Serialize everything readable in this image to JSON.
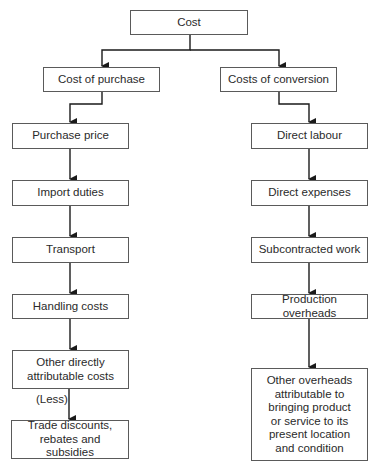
{
  "diagram": {
    "root": {
      "label": "Cost"
    },
    "branches": [
      {
        "label": "Cost of purchase",
        "items": [
          {
            "label": "Purchase price"
          },
          {
            "label": "Import duties"
          },
          {
            "label": "Transport"
          },
          {
            "label": "Handling costs"
          },
          {
            "label": "Other directly attributable costs"
          },
          {
            "label": "Trade discounts, rebates and subsidies"
          }
        ],
        "connector_note": "(Less)"
      },
      {
        "label": "Costs of conversion",
        "items": [
          {
            "label": "Direct labour"
          },
          {
            "label": "Direct expenses"
          },
          {
            "label": "Subcontracted work"
          },
          {
            "label": "Production overheads"
          },
          {
            "label": "Other overheads attributable to bringing product or service to its present location and condition"
          }
        ]
      }
    ],
    "colors": {
      "line": "#1a1a1a",
      "border": "#5a5a5a",
      "text": "#2a2a2a"
    }
  }
}
